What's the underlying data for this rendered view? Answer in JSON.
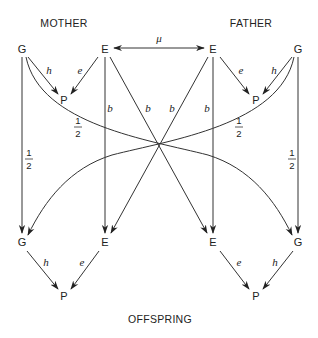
{
  "diagram": {
    "type": "path-diagram",
    "groups": {
      "mother": "MOTHER",
      "father": "FATHER",
      "offspring": "OFFSPRING"
    },
    "nodes": {
      "mother_g": "G",
      "mother_e": "E",
      "mother_p": "P",
      "father_e": "E",
      "father_g": "G",
      "father_p": "P",
      "child_g_left": "G",
      "child_e_left": "E",
      "child_p_left": "P",
      "child_e_right": "E",
      "child_g_right": "G",
      "child_p_right": "P"
    },
    "coefficients": {
      "mu": "μ",
      "h": "h",
      "e": "e",
      "b": "b",
      "half_num": "1",
      "half_den": "2"
    },
    "edges": [
      {
        "from": "mother_e",
        "to": "father_e",
        "label": "μ",
        "bidirectional": true
      },
      {
        "from": "mother_g",
        "to": "mother_p",
        "label": "h"
      },
      {
        "from": "mother_e",
        "to": "mother_p",
        "label": "e"
      },
      {
        "from": "father_e",
        "to": "father_p",
        "label": "e"
      },
      {
        "from": "father_g",
        "to": "father_p",
        "label": "h"
      },
      {
        "from": "mother_g",
        "to": "child_g_left",
        "label": "1/2"
      },
      {
        "from": "mother_g",
        "to": "child_g_right",
        "label": "1/2"
      },
      {
        "from": "father_g",
        "to": "child_g_right",
        "label": "1/2"
      },
      {
        "from": "father_g",
        "to": "child_g_left",
        "label": "1/2"
      },
      {
        "from": "mother_e",
        "to": "child_e_left",
        "label": "b"
      },
      {
        "from": "mother_e",
        "to": "child_e_right",
        "label": "b"
      },
      {
        "from": "father_e",
        "to": "child_e_left",
        "label": "b"
      },
      {
        "from": "father_e",
        "to": "child_e_right",
        "label": "b"
      },
      {
        "from": "child_g_left",
        "to": "child_p_left",
        "label": "h"
      },
      {
        "from": "child_e_left",
        "to": "child_p_left",
        "label": "e"
      },
      {
        "from": "child_e_right",
        "to": "child_p_right",
        "label": "e"
      },
      {
        "from": "child_g_right",
        "to": "child_p_right",
        "label": "h"
      }
    ]
  }
}
